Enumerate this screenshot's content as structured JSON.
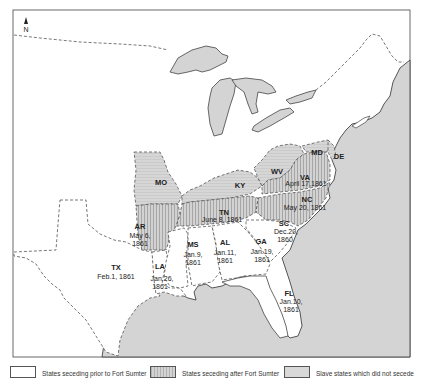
{
  "compass": {
    "label": "N"
  },
  "states": {
    "TX": {
      "abbr": "TX",
      "date": "Feb.1, 1861",
      "category": "prior"
    },
    "LA": {
      "abbr": "LA",
      "date_line1": "Jan.26,",
      "date_line2": "1861",
      "category": "prior"
    },
    "MS": {
      "abbr": "MS",
      "date_line1": "Jan.9,",
      "date_line2": "1861",
      "category": "prior"
    },
    "AL": {
      "abbr": "AL",
      "date_line1": "Jan.11,",
      "date_line2": "1861",
      "category": "prior"
    },
    "GA": {
      "abbr": "GA",
      "date_line1": "Jan.19,",
      "date_line2": "1861",
      "category": "prior"
    },
    "FL": {
      "abbr": "FL",
      "date_line1": "Jan.10,",
      "date_line2": "1861",
      "category": "prior"
    },
    "SC": {
      "abbr": "SC",
      "date_line1": "Dec.20,",
      "date_line2": "1860",
      "category": "prior"
    },
    "AR": {
      "abbr": "AR",
      "date_line1": "May 6,",
      "date_line2": "1861",
      "category": "after"
    },
    "TN": {
      "abbr": "TN",
      "date": "June 8, 1861",
      "category": "after"
    },
    "NC": {
      "abbr": "NC",
      "date": "May 20, 1861",
      "category": "after"
    },
    "VA": {
      "abbr": "VA",
      "date": "April 17,1861",
      "category": "after"
    },
    "MO": {
      "abbr": "MO",
      "category": "slave-no-secede"
    },
    "KY": {
      "abbr": "KY",
      "category": "slave-no-secede"
    },
    "WV": {
      "abbr": "WV",
      "category": "slave-no-secede"
    },
    "MD": {
      "abbr": "MD",
      "category": "slave-no-secede"
    },
    "DE": {
      "abbr": "DE",
      "category": "slave-no-secede"
    }
  },
  "legend": {
    "items": [
      {
        "label": "States seceding prior to Fort Sumter",
        "swatch": "white"
      },
      {
        "label": "States seceding after Fort Sumter",
        "swatch": "gray-hatched"
      },
      {
        "label": "Slave states which did not secede",
        "swatch": "gray"
      }
    ]
  },
  "colors": {
    "water": "#d4d4d4",
    "land": "#ffffff",
    "border": "#444444",
    "slave_state": "#d3d3d3"
  }
}
